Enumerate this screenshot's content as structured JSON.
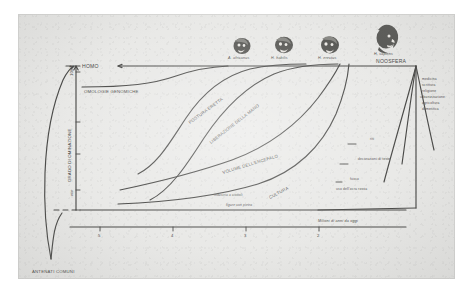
{
  "figure": {
    "axes": {
      "y_label": "GRADO DI OMINAZIONE",
      "y_top_tick": "100%",
      "y_bottom_tick": "min",
      "x_label": "Milioni di anni da oggi",
      "x_ticks": [
        "5",
        "4",
        "3",
        "2"
      ]
    },
    "top_labels": {
      "homo": "HOMO",
      "noosfera": "NOOSFERA"
    },
    "species": [
      {
        "name": "A. africanus"
      },
      {
        "name": "H. habilis"
      },
      {
        "name": "H. erectus"
      },
      {
        "name": "H. sapiens"
      }
    ],
    "curves": [
      {
        "label": "OMOLOGIE GENOMICHE"
      },
      {
        "label": "POSTURA ERETTA"
      },
      {
        "label": "LIBERAZIONE DELLA MANO"
      },
      {
        "label": "VOLUME DELL'ENCEFALO"
      },
      {
        "label": "CULTURA"
      }
    ],
    "root_label": "ANTENATI COMUNI",
    "noosphere_items": [
      "medicina",
      "scrittura",
      "religione",
      "urbanizzazione",
      "agricoltura",
      "domestica"
    ],
    "culture_events": [
      "riti",
      "decorazioni di teste",
      "fuoco",
      "uso dell'ocra rossa"
    ],
    "tool_events": [
      "industria a ciottoli",
      "figure con pietra"
    ]
  },
  "colors": {
    "paper": "#e9e9e7",
    "ink": "#4a4a48",
    "page_background": "#ffffff"
  }
}
